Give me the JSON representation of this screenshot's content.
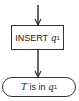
{
  "diagram": {
    "process": {
      "label": "INSERT",
      "var": "q",
      "sub": "1"
    },
    "terminal": {
      "var_t": "T",
      "text": "is in",
      "var": "q",
      "sub": "1"
    }
  }
}
